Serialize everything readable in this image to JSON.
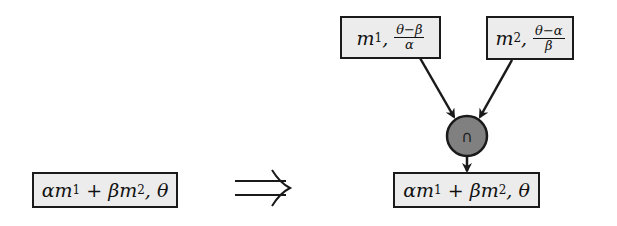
{
  "diagram": {
    "left_node": {
      "text": "αm",
      "sub1": "1",
      "mid": " + βm",
      "sub2": "2",
      "tail": ", θ"
    },
    "implies_symbol": "⟹",
    "top_left_node": {
      "var": "m",
      "sub": "1",
      "sep": ",",
      "num": "θ−β",
      "den": "α"
    },
    "top_right_node": {
      "var": "m",
      "sub": "2",
      "sep": ",",
      "num": "θ−α",
      "den": "β"
    },
    "merge_node": {
      "symbol": "∩",
      "fill": "#808080"
    },
    "bottom_node": {
      "text": "αm",
      "sub1": "1",
      "mid": " + βm",
      "sub2": "2",
      "tail": ", θ"
    }
  }
}
